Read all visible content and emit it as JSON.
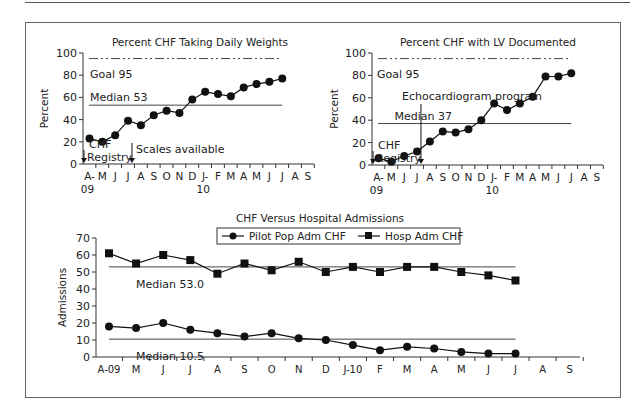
{
  "chart_data": [
    {
      "id": "daily-weights",
      "type": "line",
      "title": "Percent CHF Taking Daily Weights",
      "xlabel": "",
      "ylabel": "Percent",
      "ylim": [
        0,
        100
      ],
      "yticks": [
        0,
        20,
        40,
        60,
        80,
        100
      ],
      "categories": [
        "A-\n09",
        "M",
        "J",
        "J",
        "A",
        "S",
        "O",
        "N",
        "D",
        "J-\n10",
        "F",
        "M",
        "A",
        "M",
        "J",
        "J",
        "A",
        "S"
      ],
      "series": [
        {
          "name": "Percent CHF Taking Daily Weights",
          "values": [
            23,
            20,
            26,
            39,
            35,
            44,
            48,
            46,
            58,
            65,
            63,
            61,
            69,
            72,
            74,
            77
          ]
        }
      ],
      "reference_lines": [
        {
          "label": "Goal 95",
          "value": 95,
          "style": "dash-dot"
        },
        {
          "label": "Median 53",
          "value": 53,
          "style": "solid"
        }
      ],
      "annotations": [
        {
          "text": "CHF\nRegistry",
          "at_index": 0
        },
        {
          "text": "Scales available",
          "at_index": 3
        }
      ]
    },
    {
      "id": "lv-documented",
      "type": "line",
      "title": "Percent CHF with LV Documented",
      "xlabel": "",
      "ylabel": "Percent",
      "ylim": [
        0,
        100
      ],
      "yticks": [
        0,
        20,
        40,
        60,
        80,
        100
      ],
      "categories": [
        "A-\n09",
        "M",
        "J",
        "J",
        "A",
        "S",
        "O",
        "N",
        "D",
        "J-\n10",
        "F",
        "M",
        "A",
        "M",
        "J",
        "J",
        "A",
        "S"
      ],
      "series": [
        {
          "name": "Percent CHF with LV Documented",
          "values": [
            6,
            3,
            8,
            12,
            21,
            30,
            29,
            32,
            40,
            55,
            49,
            55,
            61,
            79,
            79,
            82
          ]
        }
      ],
      "reference_lines": [
        {
          "label": "Goal 95",
          "value": 95,
          "style": "dash-dot"
        },
        {
          "label": "Median 37",
          "value": 37,
          "style": "solid"
        }
      ],
      "annotations": [
        {
          "text": "CHF\nRegistry",
          "at_index": 0
        },
        {
          "text": "Echocardiogram program",
          "at_index": 3
        }
      ]
    },
    {
      "id": "admissions",
      "type": "line",
      "title": "CHF Versus Hospital Admissions",
      "xlabel": "",
      "ylabel": "Admissions",
      "ylim": [
        0,
        70
      ],
      "yticks": [
        0,
        10,
        20,
        30,
        40,
        50,
        60,
        70
      ],
      "legend": "top-center",
      "categories": [
        "A-09",
        "M",
        "J",
        "J",
        "A",
        "S",
        "O",
        "N",
        "D",
        "J-10",
        "F",
        "M",
        "A",
        "M",
        "J",
        "J",
        "A",
        "S"
      ],
      "series": [
        {
          "name": "Pilot Pop Adm CHF",
          "marker": "circle",
          "values": [
            18,
            17,
            20,
            16,
            14,
            12,
            14,
            11,
            10,
            7,
            4,
            6,
            5,
            3,
            2,
            2
          ]
        },
        {
          "name": "Hosp Adm CHF",
          "marker": "square",
          "values": [
            61,
            55,
            60,
            57,
            49,
            55,
            51,
            56,
            50,
            53,
            50,
            53,
            53,
            50,
            48,
            45
          ]
        }
      ],
      "reference_lines": [
        {
          "label": "Median 53.0",
          "value": 53,
          "style": "solid"
        },
        {
          "label": "Median 10.5",
          "value": 10.5,
          "style": "solid"
        }
      ]
    }
  ]
}
